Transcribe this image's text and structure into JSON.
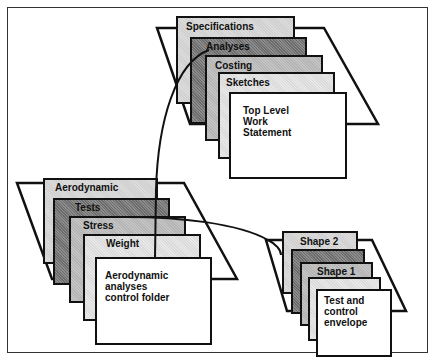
{
  "diagram": {
    "clusters": [
      {
        "id": "top",
        "cards": [
          {
            "label": "Specifications",
            "shade": "light"
          },
          {
            "label": "Analyses",
            "shade": "dark"
          },
          {
            "label": "Costing",
            "shade": "mid"
          },
          {
            "label": "Sketches",
            "shade": "pale"
          },
          {
            "label": "Top Level\nWork\nStatement",
            "shade": "white"
          }
        ]
      },
      {
        "id": "left",
        "cards": [
          {
            "label": "Aerodynamic",
            "shade": "light"
          },
          {
            "label": "Tests",
            "shade": "dark"
          },
          {
            "label": "Stress",
            "shade": "mid"
          },
          {
            "label": "Weight",
            "shade": "pale"
          },
          {
            "label": "Aerodynamic analyses\ncontrol folder",
            "shade": "white"
          }
        ]
      },
      {
        "id": "right",
        "cards": [
          {
            "label": "Shape 2",
            "shade": "light"
          },
          {
            "label": "",
            "shade": "dark"
          },
          {
            "label": "Shape 1",
            "shade": "mid"
          },
          {
            "label": "",
            "shade": "pale"
          },
          {
            "label": "Test and\ncontrol\nenvelope",
            "shade": "white"
          }
        ]
      }
    ],
    "connectors": [
      {
        "from": "top.Analyses",
        "to": "left.Aerodynamic analyses control folder"
      },
      {
        "from": "left.Tests",
        "to": "right.Shape 2"
      }
    ]
  }
}
